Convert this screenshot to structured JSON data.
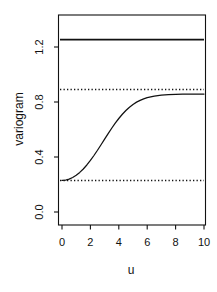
{
  "chart_data": {
    "type": "line",
    "title": "",
    "xlabel": "u",
    "ylabel": "variogram",
    "xlim": [
      0,
      10
    ],
    "ylim": [
      0.0,
      1.32
    ],
    "grid": false,
    "legend": null,
    "xticks": [
      0,
      2,
      4,
      6,
      8,
      10
    ],
    "xtick_labels": [
      "0",
      "2",
      "4",
      "6",
      "8",
      "10"
    ],
    "yticks": [
      0.0,
      0.4,
      0.8,
      1.2
    ],
    "ytick_labels": [
      "0.0",
      "0.4",
      "0.8",
      "1.2"
    ],
    "series": [
      {
        "name": "variogram model",
        "style": "solid",
        "color": "#111111",
        "x": [
          0.0,
          0.25,
          0.5,
          0.75,
          1.0,
          1.25,
          1.5,
          1.75,
          2.0,
          2.25,
          2.5,
          2.75,
          3.0,
          3.25,
          3.5,
          3.75,
          4.0,
          4.25,
          4.5,
          4.75,
          5.0,
          5.25,
          5.5,
          5.75,
          6.0,
          6.25,
          6.5,
          6.75,
          7.0,
          7.5,
          8.0,
          8.5,
          9.0,
          9.5,
          10.0
        ],
        "y": [
          0.23,
          0.232,
          0.239,
          0.251,
          0.267,
          0.288,
          0.313,
          0.342,
          0.375,
          0.411,
          0.449,
          0.489,
          0.53,
          0.57,
          0.609,
          0.646,
          0.68,
          0.711,
          0.738,
          0.762,
          0.782,
          0.799,
          0.812,
          0.823,
          0.832,
          0.838,
          0.843,
          0.847,
          0.85,
          0.854,
          0.856,
          0.857,
          0.858,
          0.858,
          0.858
        ]
      },
      {
        "name": "upper solid reference line",
        "style": "solid",
        "color": "#111111",
        "x": [
          0,
          10
        ],
        "y": [
          1.25,
          1.25
        ]
      },
      {
        "name": "upper dotted reference line",
        "style": "dotted",
        "color": "#111111",
        "x": [
          0,
          10
        ],
        "y": [
          0.89,
          0.89
        ]
      },
      {
        "name": "lower dotted reference line",
        "style": "dotted",
        "color": "#111111",
        "x": [
          0,
          10
        ],
        "y": [
          0.23,
          0.23
        ]
      }
    ]
  },
  "axes": {
    "y_title": "variogram",
    "x_title": "u",
    "y_tick_labels": [
      "1.2",
      "0.8",
      "0.4",
      "0.0"
    ],
    "x_tick_labels": [
      "0",
      "2",
      "4",
      "6",
      "8",
      "10"
    ]
  }
}
